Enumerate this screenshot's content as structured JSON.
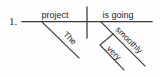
{
  "exercise": {
    "number": "1.",
    "type": "reed-kellogg-sentence-diagram",
    "sentence": "The project is going very smoothly"
  },
  "diagram": {
    "subject": "project",
    "predicate": "is going",
    "subject_modifier": "The",
    "verb_modifier": "smoothly",
    "adverb_modifier": "very",
    "line_color": "#3a3a3a",
    "text_color": "#1e1e1e",
    "background": "#fdfdfd"
  },
  "labels": {
    "project": "project",
    "is_going": "is going",
    "the": "The",
    "smoothly": "smoothly",
    "very": "very"
  }
}
